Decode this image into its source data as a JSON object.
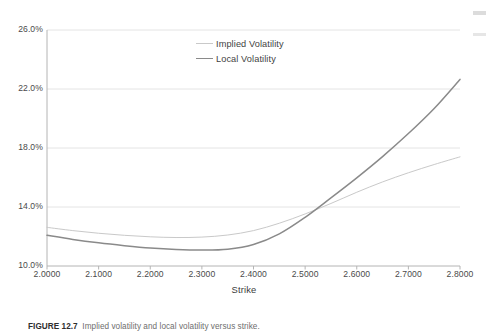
{
  "chart_data": {
    "type": "line",
    "title": "",
    "xlabel": "Strike",
    "ylabel": "",
    "xlim": [
      2.0,
      2.8
    ],
    "ylim": [
      0.1,
      0.26
    ],
    "grid": true,
    "legend_position": "inside-top-center",
    "x_tick_labels": [
      "2.0000",
      "2.1000",
      "2.2000",
      "2.3000",
      "2.4000",
      "2.5000",
      "2.6000",
      "2.7000",
      "2.8000"
    ],
    "x_tick_values": [
      2.0,
      2.1,
      2.2,
      2.3,
      2.4,
      2.5,
      2.6,
      2.7,
      2.8
    ],
    "y_tick_labels": [
      "26.0%",
      "22.0%",
      "18.0%",
      "14.0%",
      "10.0%"
    ],
    "y_tick_values": [
      0.26,
      0.22,
      0.18,
      0.14,
      0.1
    ],
    "x": [
      2.0,
      2.05,
      2.1,
      2.15,
      2.2,
      2.25,
      2.3,
      2.35,
      2.4,
      2.45,
      2.5,
      2.55,
      2.6,
      2.65,
      2.7,
      2.75,
      2.8
    ],
    "series": [
      {
        "name": "Implied Volatility",
        "color": "#c9c9c9",
        "width": 1.0,
        "values": [
          0.1262,
          0.124,
          0.1222,
          0.1208,
          0.1198,
          0.1193,
          0.1196,
          0.121,
          0.124,
          0.129,
          0.1353,
          0.1424,
          0.15,
          0.157,
          0.1632,
          0.1688,
          0.174
        ]
      },
      {
        "name": "Local Volatility",
        "color": "#8a8a8a",
        "width": 1.5,
        "values": [
          0.1208,
          0.118,
          0.1157,
          0.1138,
          0.1122,
          0.1112,
          0.1108,
          0.1114,
          0.1146,
          0.1218,
          0.133,
          0.1462,
          0.1598,
          0.1742,
          0.1898,
          0.2068,
          0.2265
        ]
      }
    ]
  },
  "legend": {
    "items": [
      {
        "label": "Implied Volatility",
        "color": "#c9c9c9",
        "thickness": "1px"
      },
      {
        "label": "Local Volatility",
        "color": "#8a8a8a",
        "thickness": "1.6px"
      }
    ]
  },
  "axis": {
    "x_title": "Strike"
  },
  "caption": {
    "number": "FIGURE 12.7",
    "text": "Implied volatility and local volatility versus strike."
  },
  "colors": {
    "gridline": "#e4e4e4",
    "axis": "#b4b4b4",
    "tick_text": "#4a4a4a",
    "implied": "#c9c9c9",
    "local": "#8a8a8a"
  }
}
